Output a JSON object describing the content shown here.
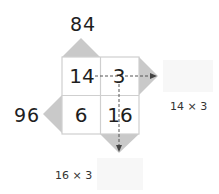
{
  "diagram": {
    "type": "lattice-multiplication",
    "top_label": "84",
    "left_label": "96",
    "cells": [
      {
        "row": 0,
        "col": 0,
        "value": "14"
      },
      {
        "row": 0,
        "col": 1,
        "value": "3"
      },
      {
        "row": 1,
        "col": 0,
        "value": "6"
      },
      {
        "row": 1,
        "col": 1,
        "value": "16"
      }
    ],
    "arrow_right_label": "14 × 3",
    "arrow_down_label": "16 × 3",
    "colors": {
      "triangle_fill": "#c8c8c8",
      "grid_line": "#d0d0d0",
      "arrow": "#555555",
      "faint_area": "#f6f6f6"
    }
  }
}
